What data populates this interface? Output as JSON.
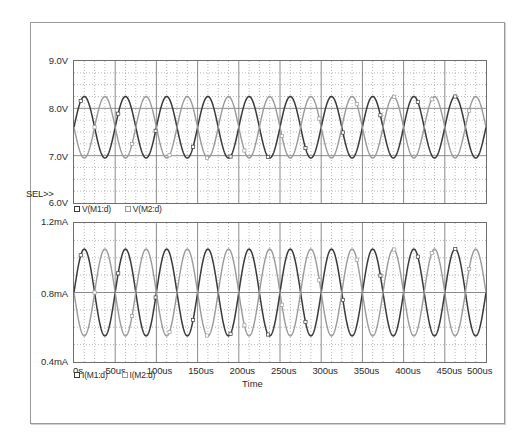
{
  "window": {
    "title": "PSpice Probe waveform viewer",
    "select_marker": "SEL>>"
  },
  "top_plot": {
    "y_ticks": [
      "9.0V",
      "8.0V",
      "7.0V",
      "6.0V"
    ],
    "legend": [
      {
        "label": "V(M1:d)",
        "color": "#3a3a3a",
        "marker": "square-outline-icon"
      },
      {
        "label": "V(M2:d)",
        "color": "#9a9a9a",
        "marker": "square-outline-icon"
      }
    ]
  },
  "bottom_plot": {
    "y_ticks": [
      "1.2mA",
      "0.8mA",
      "0.4mA"
    ],
    "legend": [
      {
        "label": "I(M1:d)",
        "color": "#3a3a3a",
        "marker": "square-outline-icon"
      },
      {
        "label": "I(M2:d)",
        "color": "#9a9a9a",
        "marker": "square-outline-icon"
      }
    ]
  },
  "x_axis": {
    "title": "Time",
    "ticks": [
      "0s",
      "50us",
      "100us",
      "150us",
      "200us",
      "250us",
      "300us",
      "350us",
      "400us",
      "450us",
      "500us"
    ]
  },
  "colors": {
    "trace1": "#3a3a3a",
    "trace2": "#9a9a9a",
    "grid_major": "#6e6e6e",
    "grid_minor": "#8c8c8c",
    "frame": "#6e6e6e",
    "outer_frame": "#9a9a9a",
    "text": "#2b2b2b",
    "background": "#ffffff"
  },
  "chart_data": [
    {
      "type": "line",
      "panel": "top",
      "title": "",
      "xlabel": "Time",
      "ylabel": "",
      "xlim": [
        0,
        500
      ],
      "ylim": [
        6.0,
        9.0
      ],
      "x_unit": "us",
      "y_unit": "V",
      "grid": true,
      "y_major_ticks": [
        6.0,
        7.0,
        8.0,
        9.0
      ],
      "y_minor_step": 0.25,
      "x_major_ticks": [
        0,
        50,
        100,
        150,
        200,
        250,
        300,
        350,
        400,
        450,
        500
      ],
      "x_minor_step": 12.5,
      "legend_position": "below-left",
      "series": [
        {
          "name": "V(M1:d)",
          "color": "#3a3a3a",
          "waveform": "sine",
          "offset_v": 7.6,
          "amplitude_v": 0.65,
          "period_us": 50,
          "phase_deg": 0,
          "min_v": 6.95,
          "max_v": 8.25,
          "cycles": 10
        },
        {
          "name": "V(M2:d)",
          "color": "#9a9a9a",
          "waveform": "sine",
          "offset_v": 7.6,
          "amplitude_v": 0.65,
          "period_us": 50,
          "phase_deg": 180,
          "min_v": 6.95,
          "max_v": 8.25,
          "cycles": 10
        }
      ]
    },
    {
      "type": "line",
      "panel": "bottom",
      "title": "",
      "xlabel": "Time",
      "ylabel": "",
      "xlim": [
        0,
        500
      ],
      "ylim": [
        0.4,
        1.2
      ],
      "x_unit": "us",
      "y_unit": "mA",
      "grid": true,
      "y_major_ticks": [
        0.4,
        0.8,
        1.2
      ],
      "y_minor_step": 0.1,
      "x_major_ticks": [
        0,
        50,
        100,
        150,
        200,
        250,
        300,
        350,
        400,
        450,
        500
      ],
      "x_minor_step": 12.5,
      "legend_position": "below-left",
      "series": [
        {
          "name": "I(M1:d)",
          "color": "#3a3a3a",
          "waveform": "sine",
          "offset_ma": 0.8,
          "amplitude_ma": 0.25,
          "period_us": 50,
          "phase_deg": 0,
          "min_ma": 0.55,
          "max_ma": 1.05,
          "cycles": 10
        },
        {
          "name": "I(M2:d)",
          "color": "#9a9a9a",
          "waveform": "sine",
          "offset_ma": 0.8,
          "amplitude_ma": 0.25,
          "period_us": 50,
          "phase_deg": 180,
          "min_ma": 0.55,
          "max_ma": 1.05,
          "cycles": 10
        }
      ]
    }
  ]
}
